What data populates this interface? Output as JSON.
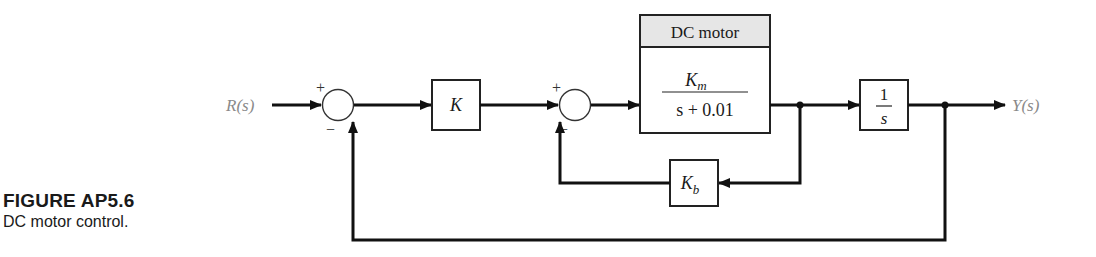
{
  "caption": {
    "title": "FIGURE AP5.6",
    "text": "DC motor control."
  },
  "signals": {
    "input": "R(s)",
    "output": "Y(s)"
  },
  "blocks": {
    "gain": {
      "label": "K"
    },
    "motor": {
      "header": "DC motor",
      "numerator_main": "K",
      "numerator_sub": "m",
      "denominator": "s + 0.01"
    },
    "integrator": {
      "numerator": "1",
      "denominator": "s"
    },
    "back_emf": {
      "main": "K",
      "sub": "b"
    }
  },
  "summing_junctions": [
    {
      "id": "sum1",
      "plus": "+",
      "minus": "−"
    },
    {
      "id": "sum2",
      "plus": "+",
      "minus": "−"
    }
  ],
  "colors": {
    "line": "#111111",
    "signal_label": "#8a8a8a",
    "header_fill": "#e6e6e6"
  }
}
